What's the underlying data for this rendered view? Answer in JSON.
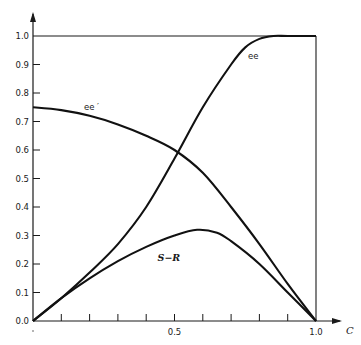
{
  "chart_data": {
    "type": "line",
    "title": "",
    "xlabel": "C",
    "ylabel": "",
    "xlim": [
      0,
      1.0
    ],
    "ylim": [
      0,
      1.0
    ],
    "grid": false,
    "legend": "inline labels on curves",
    "x_ticks": [
      0.1,
      0.2,
      0.3,
      0.4,
      0.5,
      0.6,
      0.7,
      0.8,
      0.9,
      1.0
    ],
    "x_tick_labels": [
      {
        "value": 0.5,
        "label": "0.5"
      },
      {
        "value": 1.0,
        "label": "1.0"
      }
    ],
    "y_tick_labels": [
      "0.0",
      "0.1",
      "0.2",
      "0.3",
      "0.4",
      "0.5",
      "0.6",
      "0.7",
      "0.8",
      "0.9",
      "1.0"
    ],
    "reference_lines": [
      {
        "name": "upper-bound",
        "orientation": "horizontal",
        "value": 1.0
      },
      {
        "name": "right-bound",
        "orientation": "vertical",
        "value": 1.0
      }
    ],
    "series": [
      {
        "name": "ee",
        "label": "ee",
        "x": [
          0,
          0.1,
          0.2,
          0.3,
          0.4,
          0.5,
          0.6,
          0.7,
          0.75,
          0.8,
          0.85,
          0.9,
          1.0
        ],
        "y": [
          0,
          0.08,
          0.17,
          0.27,
          0.4,
          0.57,
          0.75,
          0.9,
          0.96,
          0.99,
          1.0,
          1.0,
          1.0
        ],
        "label_pos": [
          0.76,
          0.92
        ]
      },
      {
        "name": "ee_prime",
        "label": "ee ′",
        "x": [
          0,
          0.1,
          0.2,
          0.3,
          0.4,
          0.5,
          0.6,
          0.7,
          0.8,
          0.9,
          1.0
        ],
        "y": [
          0.75,
          0.74,
          0.72,
          0.69,
          0.65,
          0.6,
          0.52,
          0.4,
          0.27,
          0.13,
          0
        ],
        "label_pos": [
          0.18,
          0.74
        ]
      },
      {
        "name": "S-R",
        "label": "S−R",
        "x": [
          0,
          0.1,
          0.2,
          0.3,
          0.4,
          0.5,
          0.58,
          0.65,
          0.7,
          0.8,
          0.9,
          1.0
        ],
        "y": [
          0,
          0.08,
          0.15,
          0.21,
          0.26,
          0.3,
          0.32,
          0.31,
          0.28,
          0.2,
          0.1,
          0
        ],
        "label_pos": [
          0.44,
          0.21
        ]
      }
    ]
  },
  "plot_area": {
    "x0": 33,
    "y0": 321,
    "x1": 316,
    "y1": 36
  }
}
